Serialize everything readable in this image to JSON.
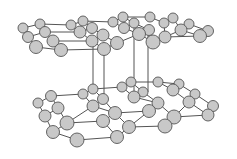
{
  "diagram": {
    "type": "bilayer hexagonal lattice (graphite-like)",
    "colors": {
      "atom_fill": "#c8c8c8",
      "atom_stroke": "#555555",
      "bond": "#555555",
      "background": "#ffffff"
    },
    "top_layer": [
      [
        23,
        28,
        5
      ],
      [
        40,
        24,
        5
      ],
      [
        28,
        37,
        5.5
      ],
      [
        45,
        32,
        5.5
      ],
      [
        36,
        47,
        6.5
      ],
      [
        53,
        41,
        6
      ],
      [
        61,
        50,
        6.5
      ],
      [
        71,
        25,
        5
      ],
      [
        83,
        21,
        5
      ],
      [
        80,
        32,
        6
      ],
      [
        92,
        28,
        5.5
      ],
      [
        103,
        35,
        6
      ],
      [
        92,
        41,
        6
      ],
      [
        104,
        49,
        6.5
      ],
      [
        117,
        43,
        6.5
      ],
      [
        113,
        22,
        5
      ],
      [
        123,
        17,
        5
      ],
      [
        124,
        28,
        5.5
      ],
      [
        134,
        23,
        5
      ],
      [
        139,
        34,
        6.5
      ],
      [
        149,
        30,
        5.5
      ],
      [
        150,
        17,
        5
      ],
      [
        153,
        42,
        7
      ],
      [
        164,
        23,
        5
      ],
      [
        173,
        18,
        5
      ],
      [
        165,
        37,
        6
      ],
      [
        181,
        30,
        6
      ],
      [
        189,
        24,
        5
      ],
      [
        200,
        36,
        6.5
      ],
      [
        208,
        31,
        5.5
      ]
    ],
    "top_bonds": [
      [
        0,
        1
      ],
      [
        0,
        2
      ],
      [
        1,
        3
      ],
      [
        2,
        3
      ],
      [
        2,
        4
      ],
      [
        3,
        5
      ],
      [
        4,
        6
      ],
      [
        5,
        6
      ],
      [
        1,
        7
      ],
      [
        7,
        8
      ],
      [
        7,
        9
      ],
      [
        8,
        10
      ],
      [
        9,
        10
      ],
      [
        9,
        12
      ],
      [
        10,
        11
      ],
      [
        11,
        12
      ],
      [
        12,
        13
      ],
      [
        11,
        14
      ],
      [
        8,
        15
      ],
      [
        15,
        16
      ],
      [
        15,
        17
      ],
      [
        16,
        18
      ],
      [
        17,
        18
      ],
      [
        17,
        19
      ],
      [
        18,
        20
      ],
      [
        19,
        20
      ],
      [
        16,
        21
      ],
      [
        20,
        22
      ],
      [
        21,
        23
      ],
      [
        23,
        24
      ],
      [
        23,
        25
      ],
      [
        24,
        26
      ],
      [
        25,
        26
      ],
      [
        26,
        27
      ],
      [
        26,
        28
      ],
      [
        27,
        29
      ],
      [
        28,
        29
      ],
      [
        3,
        9
      ],
      [
        5,
        12
      ],
      [
        6,
        13
      ],
      [
        13,
        14
      ],
      [
        14,
        19
      ],
      [
        19,
        22
      ],
      [
        22,
        25
      ],
      [
        25,
        28
      ]
    ],
    "bottom_layer": [
      [
        93,
        89,
        5
      ],
      [
        83,
        94,
        5
      ],
      [
        51,
        96,
        5.5
      ],
      [
        38,
        103,
        5
      ],
      [
        58,
        108,
        6
      ],
      [
        45,
        116,
        6
      ],
      [
        67,
        123,
        7
      ],
      [
        53,
        132,
        6.5
      ],
      [
        77,
        140,
        7
      ],
      [
        93,
        106,
        6
      ],
      [
        103,
        99,
        5.5
      ],
      [
        115,
        113,
        6.5
      ],
      [
        103,
        121,
        6.5
      ],
      [
        117,
        137,
        6.5
      ],
      [
        129,
        127,
        6.5
      ],
      [
        122,
        87,
        5
      ],
      [
        131,
        82,
        5
      ],
      [
        134,
        97,
        6
      ],
      [
        143,
        92,
        5
      ],
      [
        158,
        82,
        5
      ],
      [
        158,
        103,
        6
      ],
      [
        149,
        111,
        6.5
      ],
      [
        173,
        90,
        6
      ],
      [
        179,
        84,
        5
      ],
      [
        195,
        94,
        5
      ],
      [
        189,
        102,
        6
      ],
      [
        174,
        117,
        7
      ],
      [
        165,
        126,
        7
      ],
      [
        213,
        106,
        5.5
      ],
      [
        208,
        115,
        6
      ]
    ],
    "bottom_bonds": [
      [
        0,
        1
      ],
      [
        1,
        2
      ],
      [
        2,
        3
      ],
      [
        2,
        4
      ],
      [
        3,
        5
      ],
      [
        4,
        5
      ],
      [
        4,
        6
      ],
      [
        5,
        7
      ],
      [
        6,
        7
      ],
      [
        7,
        8
      ],
      [
        6,
        9
      ],
      [
        1,
        9
      ],
      [
        0,
        10
      ],
      [
        9,
        10
      ],
      [
        9,
        11
      ],
      [
        10,
        11
      ],
      [
        11,
        12
      ],
      [
        12,
        6
      ],
      [
        12,
        13
      ],
      [
        13,
        14
      ],
      [
        8,
        13
      ],
      [
        11,
        14
      ],
      [
        0,
        15
      ],
      [
        15,
        16
      ],
      [
        15,
        17
      ],
      [
        16,
        18
      ],
      [
        17,
        18
      ],
      [
        16,
        19
      ],
      [
        18,
        20
      ],
      [
        17,
        20
      ],
      [
        20,
        21
      ],
      [
        21,
        14
      ],
      [
        21,
        11
      ],
      [
        19,
        22
      ],
      [
        19,
        23
      ],
      [
        22,
        23
      ],
      [
        23,
        24
      ],
      [
        22,
        25
      ],
      [
        24,
        25
      ],
      [
        25,
        26
      ],
      [
        20,
        26
      ],
      [
        26,
        27
      ],
      [
        27,
        14
      ],
      [
        24,
        28
      ],
      [
        25,
        29
      ],
      [
        28,
        29
      ],
      [
        29,
        26
      ]
    ],
    "interlayer_links": [
      [
        93,
        41,
        93,
        89
      ],
      [
        104,
        49,
        104,
        99
      ],
      [
        134,
        23,
        134,
        97
      ],
      [
        148,
        30,
        148,
        92
      ]
    ]
  }
}
